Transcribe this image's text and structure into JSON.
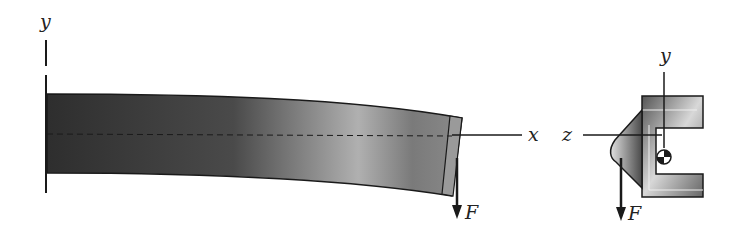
{
  "figure": {
    "type": "cantilever-beam-diagram",
    "beam_view": {
      "axis_y_label": "y",
      "axis_x_label": "x",
      "load_label": "F"
    },
    "section_view": {
      "axis_y_label": "y",
      "axis_z_label": "z",
      "load_label": "F",
      "section_shape": "channel-with-lip",
      "centroid_marker": "shear-center-symbol"
    },
    "colors": {
      "beam_dark": "#2b2b2b",
      "beam_light": "#b8b8b8",
      "line": "#1a1a1a",
      "background": "#ffffff"
    }
  }
}
